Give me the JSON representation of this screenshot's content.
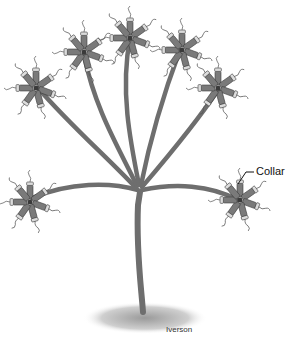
{
  "figure": {
    "labels": [
      {
        "id": "collar",
        "text": "Collar"
      }
    ],
    "credit": "Iverson",
    "colors": {
      "stalk": "#6e6e6e",
      "stalk_dark": "#4a4a4a",
      "cell_body": "#7a7a7a",
      "cell_rim": "#d8d8d8",
      "flagellum": "#555555",
      "ground": "#bdbdbd",
      "leader_line": "#111111"
    },
    "cluster_count": 7
  }
}
